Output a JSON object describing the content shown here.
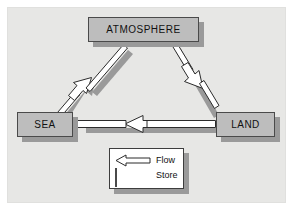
{
  "figure": {
    "title": "",
    "background_color": "#e7e7e5",
    "frame_color": "#e0e0de",
    "store_fill": "#bdbdbd",
    "store_border": "#4a4a4a",
    "shadow_color": "#9a9a9a",
    "legend_fill": "#ffffff",
    "legend_border": "#3d3d3d",
    "flow_fill": "#ffffff",
    "flow_outline": "#2b2b2b"
  },
  "stores": [
    {
      "id": "atmosphere",
      "label": "ATMOSPHERE"
    },
    {
      "id": "sea",
      "label": "SEA"
    },
    {
      "id": "land",
      "label": "LAND"
    }
  ],
  "flows": [
    {
      "id": "sea-to-atmosphere",
      "from": "SEA",
      "to": "ATMOSPHERE",
      "direction": "up-right"
    },
    {
      "id": "atmosphere-to-land",
      "from": "ATMOSPHERE",
      "to": "LAND",
      "direction": "down-right"
    },
    {
      "id": "land-to-sea",
      "from": "LAND",
      "to": "SEA",
      "direction": "left"
    }
  ],
  "legend": {
    "items": [
      {
        "id": "flow",
        "symbol": "hollow-arrow",
        "label": "Flow"
      },
      {
        "id": "store",
        "symbol": "gray-rectangle",
        "label": "Store"
      }
    ]
  }
}
